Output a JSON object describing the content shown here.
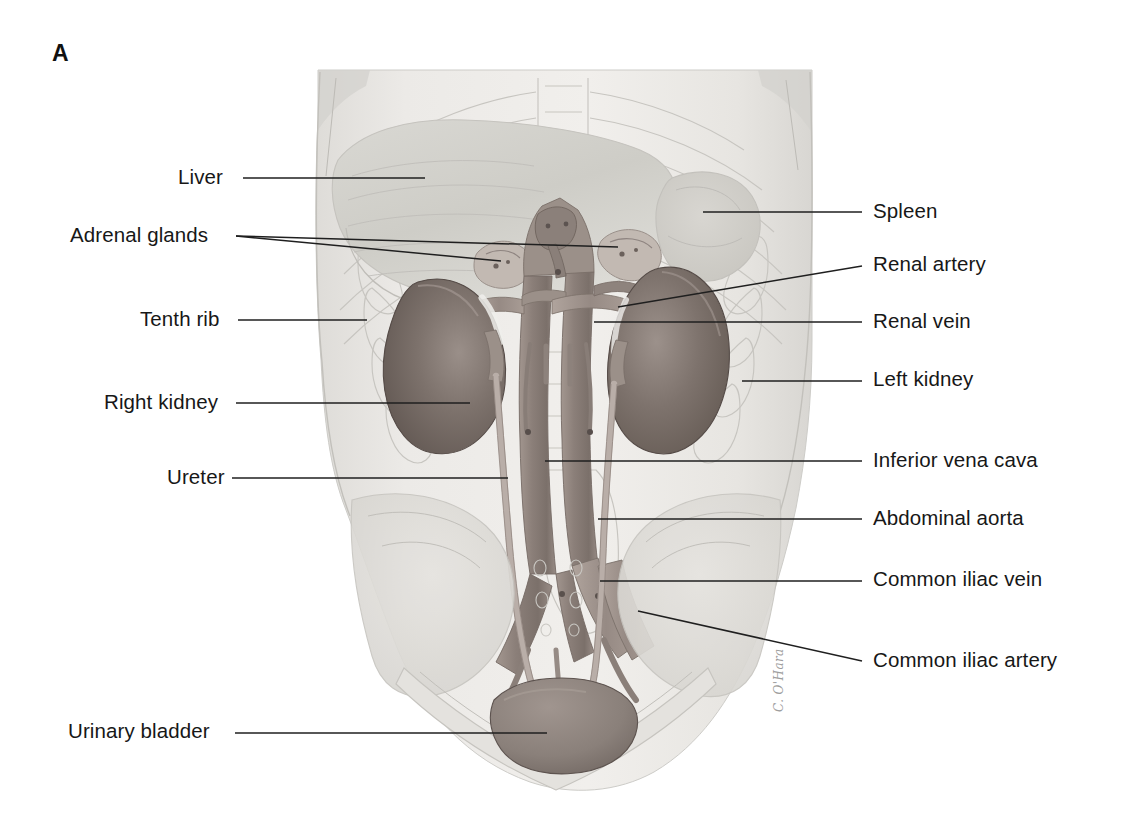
{
  "figure": {
    "panel_letter": "A",
    "artist_signature": "C. O'Hara"
  },
  "labels_left": [
    {
      "id": "liver",
      "text": "Liver",
      "x": 178,
      "y": 167
    },
    {
      "id": "adrenal-glands",
      "text": "Adrenal glands",
      "x": 70,
      "y": 225
    },
    {
      "id": "tenth-rib",
      "text": "Tenth rib",
      "x": 140,
      "y": 309
    },
    {
      "id": "right-kidney",
      "text": "Right kidney",
      "x": 104,
      "y": 392
    },
    {
      "id": "ureter",
      "text": "Ureter",
      "x": 167,
      "y": 467
    },
    {
      "id": "urinary-bladder",
      "text": "Urinary bladder",
      "x": 68,
      "y": 721
    }
  ],
  "labels_right": [
    {
      "id": "spleen",
      "text": "Spleen",
      "x": 873,
      "y": 201
    },
    {
      "id": "renal-artery",
      "text": "Renal artery",
      "x": 873,
      "y": 254
    },
    {
      "id": "renal-vein",
      "text": "Renal vein",
      "x": 873,
      "y": 311
    },
    {
      "id": "left-kidney",
      "text": "Left kidney",
      "x": 873,
      "y": 369
    },
    {
      "id": "inferior-vena-cava",
      "text": "Inferior vena cava",
      "x": 873,
      "y": 450
    },
    {
      "id": "abdominal-aorta",
      "text": "Abdominal aorta",
      "x": 873,
      "y": 508
    },
    {
      "id": "common-iliac-vein",
      "text": "Common iliac vein",
      "x": 873,
      "y": 569
    },
    {
      "id": "common-iliac-artery",
      "text": "Common iliac artery",
      "x": 873,
      "y": 650
    }
  ],
  "leaders": [
    {
      "id": "liver",
      "points": "243,178 425,178"
    },
    {
      "id": "adrenal-glands-left",
      "points": "236,236 501,261"
    },
    {
      "id": "adrenal-glands-right",
      "points": "236,236 618,247"
    },
    {
      "id": "tenth-rib",
      "points": "238,320 367,320"
    },
    {
      "id": "right-kidney",
      "points": "236,403 470,403"
    },
    {
      "id": "ureter",
      "points": "232,478 508,478"
    },
    {
      "id": "urinary-bladder",
      "points": "235,733 547,733"
    },
    {
      "id": "spleen",
      "points": "862,212 703,212"
    },
    {
      "id": "renal-artery",
      "points": "862,266 618,307"
    },
    {
      "id": "renal-vein",
      "points": "862,322 594,322"
    },
    {
      "id": "left-kidney",
      "points": "862,381 742,381"
    },
    {
      "id": "inferior-vena-cava",
      "points": "862,461 545,461"
    },
    {
      "id": "abdominal-aorta",
      "points": "862,519 598,519"
    },
    {
      "id": "common-iliac-vein",
      "points": "862,581 600,581"
    },
    {
      "id": "common-iliac-artery",
      "points": "862,661 638,611"
    }
  ],
  "colors": {
    "ink": "#171717",
    "leader": "#1f1f1f",
    "body_fill": "#e9e9e7",
    "body_edge": "#c9c8c4",
    "organ_pale": "#dbdad6",
    "liver": "#d2d1cc",
    "kidney_dark": "#6f6560",
    "kidney_mid": "#8d827c",
    "vessel": "#8a7f7a",
    "vessel_light": "#a79c96",
    "bone_line": "#c4c2be",
    "bladder": "#8b817c"
  }
}
